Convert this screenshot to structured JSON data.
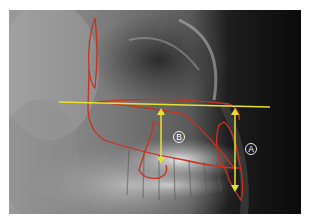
{
  "figure": {
    "type": "lateral cephalometric radiograph with tracing",
    "labels": {
      "a": "A",
      "b": "B"
    },
    "colors": {
      "tracing": "#c8321e",
      "reference_line": "#e8e030",
      "label": "#ffffff",
      "background_dark": "#0c0c0c"
    }
  }
}
